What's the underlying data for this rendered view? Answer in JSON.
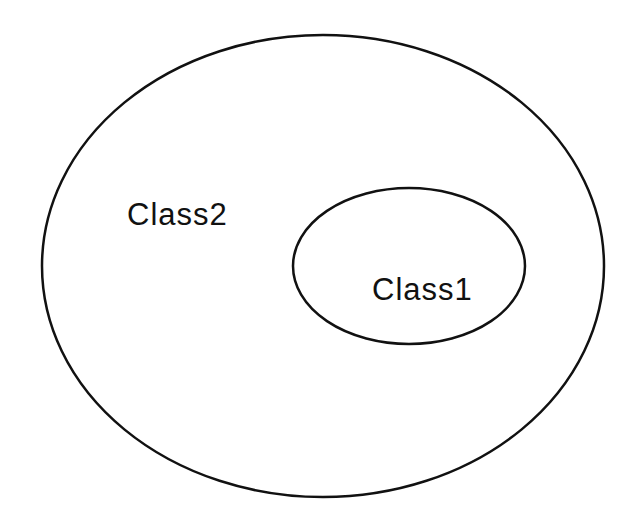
{
  "diagram": {
    "type": "nested-set-diagram",
    "stroke_color": "#111111",
    "background": "#ffffff",
    "sets": [
      {
        "id": "outer",
        "label": "Class2",
        "contains": [
          "inner"
        ]
      },
      {
        "id": "inner",
        "label": "Class1",
        "contains": []
      }
    ]
  }
}
